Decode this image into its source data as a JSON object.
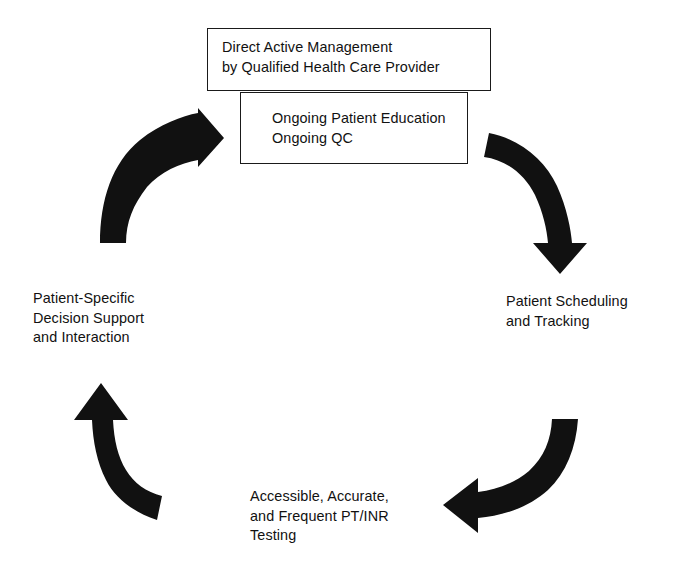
{
  "diagram": {
    "type": "cyclic-flow",
    "background_color": "#ffffff",
    "ink_color": "#111111",
    "boxes": [
      {
        "id": "management",
        "name": "direct-active-management-box",
        "lines": "Direct Active Management\nby Qualified Health Care Provider"
      },
      {
        "id": "ongoing",
        "name": "ongoing-education-box",
        "lines": "Ongoing Patient Education\nOngoing QC"
      }
    ],
    "labels": [
      {
        "id": "scheduling",
        "name": "patient-scheduling-label",
        "lines": "Patient Scheduling\nand Tracking"
      },
      {
        "id": "testing",
        "name": "ptinr-testing-label",
        "lines": "Accessible, Accurate,\nand Frequent PT/INR\nTesting"
      },
      {
        "id": "decision",
        "name": "decision-support-label",
        "lines": "Patient-Specific\nDecision Support\nand Interaction"
      }
    ],
    "arrows": [
      {
        "id": "arrow-top-left",
        "name": "arrow-to-management",
        "direction": "up-right",
        "points_to": "management"
      },
      {
        "id": "arrow-top-right",
        "name": "arrow-to-scheduling",
        "direction": "down-right",
        "points_to": "scheduling"
      },
      {
        "id": "arrow-bottom-right",
        "name": "arrow-to-testing",
        "direction": "down-left",
        "points_to": "testing"
      },
      {
        "id": "arrow-bottom-left",
        "name": "arrow-to-decision-support",
        "direction": "up-left",
        "points_to": "decision"
      }
    ]
  }
}
